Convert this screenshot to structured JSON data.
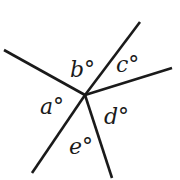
{
  "diagram": {
    "type": "angles-around-point",
    "center": {
      "x": 85,
      "y": 95
    },
    "stroke_color": "#1a1a1a",
    "background": "#ffffff",
    "rays": [
      {
        "name": "ray-upper-left",
        "x2": 4,
        "y2": 50
      },
      {
        "name": "ray-upper-right",
        "x2": 140,
        "y2": 22
      },
      {
        "name": "ray-right",
        "x2": 172,
        "y2": 68
      },
      {
        "name": "ray-lower",
        "x2": 112,
        "y2": 178
      },
      {
        "name": "ray-lower-left",
        "x2": 32,
        "y2": 173
      }
    ],
    "angle_labels": [
      {
        "name": "a",
        "text": "a°",
        "x": 40,
        "y": 96
      },
      {
        "name": "b",
        "text": "b°",
        "x": 70,
        "y": 59
      },
      {
        "name": "c",
        "text": "c°",
        "x": 116,
        "y": 54
      },
      {
        "name": "d",
        "text": "d°",
        "x": 104,
        "y": 106
      },
      {
        "name": "e",
        "text": "e°",
        "x": 69,
        "y": 136
      }
    ]
  }
}
